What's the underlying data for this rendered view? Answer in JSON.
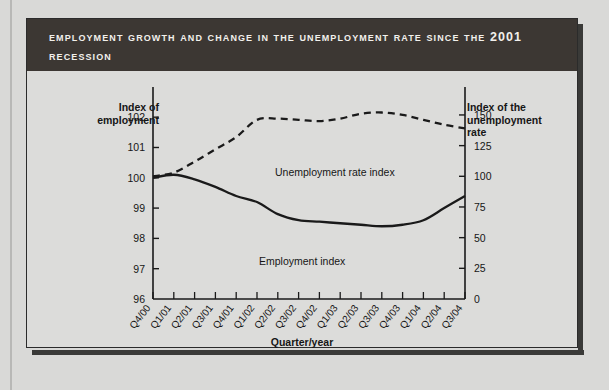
{
  "figure": {
    "title": "Employment Growth and Change in the Unemployment Rate Since the 2001 Recession",
    "title_color": "#3c3733",
    "background_color": "#dcdcda"
  },
  "axes": {
    "left_title": "Index of\nemployment",
    "left_title_line1": "Index of",
    "left_title_line2": "employment",
    "right_title_line1": "Index of the",
    "right_title_line2": "unemployment",
    "right_title_line3": "rate",
    "x_title": "Quarter/year"
  },
  "series_labels": {
    "unemployment": "Unemployment rate index",
    "employment": "Employment index"
  },
  "chart_data": {
    "type": "line",
    "title": "Employment Growth and Change in the Unemployment Rate Since the 2001 Recession",
    "xlabel": "Quarter/year",
    "ylabel": "Index of employment",
    "y2label": "Index of the unemployment rate",
    "grid": false,
    "legend": "inline-annotations",
    "categories": [
      "Q4/00",
      "Q1/01",
      "Q2/01",
      "Q3/01",
      "Q4/01",
      "Q1/02",
      "Q2/02",
      "Q3/02",
      "Q4/02",
      "Q1/03",
      "Q2/03",
      "Q3/03",
      "Q4/03",
      "Q1/04",
      "Q2/04",
      "Q3/04"
    ],
    "ylim": [
      96,
      102.6
    ],
    "yticks": [
      96,
      97,
      98,
      99,
      100,
      101,
      102
    ],
    "y2lim": [
      0,
      163
    ],
    "y2ticks": [
      0,
      25,
      50,
      75,
      100,
      125,
      150
    ],
    "series": [
      {
        "name": "Employment index",
        "axis": "left",
        "style": "solid",
        "color": "#1a1a1a",
        "values": [
          100.0,
          100.1,
          99.95,
          99.7,
          99.4,
          99.2,
          98.8,
          98.6,
          98.55,
          98.5,
          98.45,
          98.4,
          98.45,
          98.6,
          99.0,
          99.4
        ]
      },
      {
        "name": "Unemployment rate index",
        "axis": "right",
        "style": "dashed",
        "color": "#1a1a1a",
        "values": [
          100,
          103,
          112,
          122,
          132,
          146,
          147,
          146,
          145,
          147,
          151,
          152,
          150,
          146,
          142,
          139
        ]
      }
    ]
  }
}
